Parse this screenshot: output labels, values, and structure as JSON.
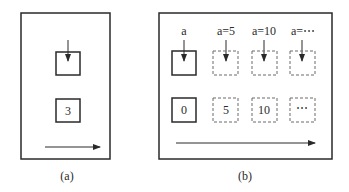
{
  "panels": {
    "a": {
      "caption": "(a)",
      "box_top_value": "",
      "box_bottom_value": "3"
    },
    "b": {
      "caption": "(b)",
      "columns": [
        {
          "label": "a",
          "value": "0",
          "style": "solid"
        },
        {
          "label": "a=5",
          "value": "5",
          "style": "dashed"
        },
        {
          "label": "a=10",
          "value": "10",
          "style": "dashed"
        },
        {
          "label": "a=⋯",
          "value": "⋯",
          "style": "dashed"
        }
      ]
    }
  },
  "colors": {
    "stroke": "#2a2a2a",
    "dashed": "#6a6a6a",
    "background": "#ffffff"
  }
}
